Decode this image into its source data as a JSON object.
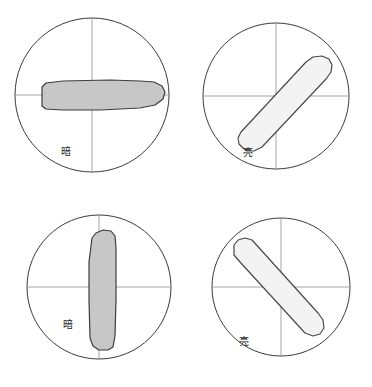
{
  "figure": {
    "background_color": "#ffffff",
    "grid": {
      "rows": 2,
      "columns": 2
    },
    "colors": {
      "circle_stroke": "#3b3b3b",
      "crosshair_stroke": "#9a9a9a",
      "dark_fill": "#c7c7c7",
      "bright_fill": "#f3f3f3",
      "grain_stroke": "#3d3d3d",
      "label_color": "#262626"
    }
  },
  "panels": [
    {
      "id": "panel-top-left",
      "position": "top-left",
      "label": "暗",
      "label_meaning": "dark",
      "state": "extinction",
      "grain_orientation_degrees": 0,
      "grain_orientation_name": "horizontal",
      "fill": "#c7c7c7",
      "circle": {
        "cx": 92,
        "cy": 95,
        "r": 77
      },
      "label_point": {
        "x": 66,
        "y": 152
      }
    },
    {
      "id": "panel-top-right",
      "position": "top-right",
      "label": "亮",
      "label_meaning": "bright",
      "state": "illuminated",
      "grain_orientation_degrees": 45,
      "grain_orientation_name": "diagonal-up-right",
      "fill": "#f3f3f3",
      "circle": {
        "cx": 276,
        "cy": 96,
        "r": 73
      },
      "label_point": {
        "x": 248,
        "y": 153
      }
    },
    {
      "id": "panel-bottom-left",
      "position": "bottom-left",
      "label": "暗",
      "label_meaning": "dark",
      "state": "extinction",
      "grain_orientation_degrees": 90,
      "grain_orientation_name": "vertical",
      "fill": "#c7c7c7",
      "circle": {
        "cx": 99,
        "cy": 287,
        "r": 72
      },
      "label_point": {
        "x": 68,
        "y": 325
      }
    },
    {
      "id": "panel-bottom-right",
      "position": "bottom-right",
      "label": "亮",
      "label_meaning": "bright",
      "state": "illuminated",
      "grain_orientation_degrees": -45,
      "grain_orientation_name": "diagonal-down-right",
      "fill": "#f3f3f3",
      "circle": {
        "cx": 281,
        "cy": 287,
        "r": 69
      },
      "label_point": {
        "x": 244,
        "y": 342
      }
    }
  ]
}
